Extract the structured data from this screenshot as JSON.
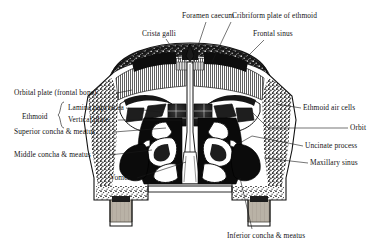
{
  "figure": {
    "style": "black-and-white anatomical engraving",
    "background_color": "#ffffff",
    "ink_color": "#1a1a1a",
    "bone_fill": "#ffffff",
    "cavity_fill": "#111111",
    "tooth_fill": "#b9b2a6",
    "cancellous_tone": "#8d8d8d"
  },
  "labels": {
    "top": [
      {
        "id": "crista-galli",
        "text": "Crista galli",
        "x": 142,
        "y": 36,
        "align": "left"
      },
      {
        "id": "foramen-caecum",
        "text": "Foramen caecum",
        "x": 182,
        "y": 18,
        "align": "left"
      },
      {
        "id": "cribriform-plate",
        "text": "Cribriform plate of ethmoid",
        "x": 232,
        "y": 18,
        "align": "left"
      },
      {
        "id": "frontal-sinus",
        "text": "Frontal sinus",
        "x": 253,
        "y": 36,
        "align": "left"
      }
    ],
    "left": [
      {
        "id": "orbital-plate",
        "text": "Orbital plate (frontal bone)",
        "x": 14,
        "y": 95
      },
      {
        "id": "lamina-papyracea",
        "text": "Lamina papyracea",
        "x": 68,
        "y": 110
      },
      {
        "id": "vertical-plate",
        "text": "Vertical plate",
        "x": 68,
        "y": 122
      },
      {
        "id": "superior-concha",
        "text": "Superior concha & meatus",
        "x": 14,
        "y": 134
      },
      {
        "id": "middle-concha",
        "text": "Middle concha & meatus",
        "x": 14,
        "y": 157
      },
      {
        "id": "vomer",
        "text": "Vomer",
        "x": 110,
        "y": 180
      }
    ],
    "brace_group": {
      "id": "ethmoid-group",
      "text": "Ethmoid",
      "x": 22,
      "y": 116,
      "members": [
        "lamina-papyracea",
        "vertical-plate"
      ]
    },
    "right": [
      {
        "id": "ethmoid-air-cells",
        "text": "Ethmoid air cells",
        "x": 303,
        "y": 110
      },
      {
        "id": "orbit",
        "text": "Orbit",
        "x": 350,
        "y": 130
      },
      {
        "id": "uncinate-process",
        "text": "Uncinate process",
        "x": 305,
        "y": 148
      },
      {
        "id": "maxillary-sinus",
        "text": "Maxillary sinus",
        "x": 310,
        "y": 165
      }
    ],
    "bottom": [
      {
        "id": "inferior-concha",
        "text": "Inferior concha & meatus",
        "x": 227,
        "y": 238
      }
    ]
  }
}
